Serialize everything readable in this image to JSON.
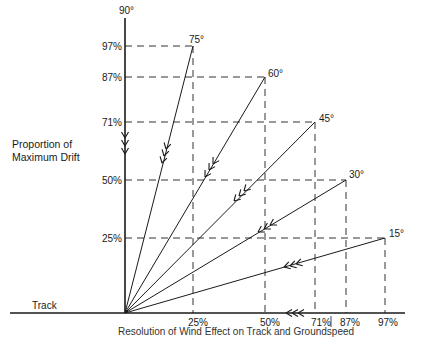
{
  "diagram": {
    "y_axis_title_line1": "Proportion of",
    "y_axis_title_line2": "Maximum Drift",
    "x_axis_title": "Track",
    "top_angle_label": "90°",
    "caption": "Resolution of Wind Effect on Track and Groundspeed",
    "vectors": [
      {
        "angle": "75°",
        "drift": "97%",
        "along": "25%"
      },
      {
        "angle": "60°",
        "drift": "87%",
        "along": "50%"
      },
      {
        "angle": "45°",
        "drift": "71%",
        "along": "71%"
      },
      {
        "angle": "30°",
        "drift": "50%",
        "along": "87%"
      },
      {
        "angle": "15°",
        "drift": "25%",
        "along": "97%"
      }
    ],
    "y_ticks": [
      "97%",
      "87%",
      "71%",
      "50%",
      "25%"
    ],
    "x_ticks": [
      "25%",
      "50%",
      "71%",
      "87%",
      "97%"
    ]
  }
}
